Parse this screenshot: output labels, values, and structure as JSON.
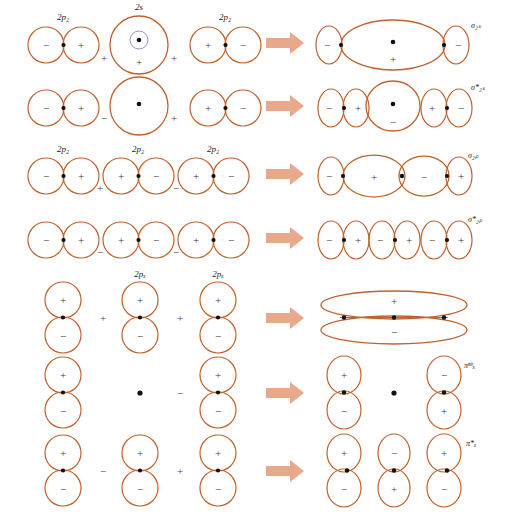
{
  "figure": {
    "colors": {
      "orbital_stroke": "#c0622d",
      "arrow_fill": "#e8a88a",
      "nucleus_dot": "#111111",
      "text": "#1a1a1a",
      "background": "#ffffff"
    }
  },
  "arrow": {
    "glyph": "right-arrow",
    "count": 7
  },
  "rows": [
    {
      "id": "row-sigma-2s",
      "left": {
        "orbitals": [
          {
            "label": "2p₂",
            "type": "p-horizontal",
            "lobes": [
              "−",
              "+"
            ]
          },
          {
            "label": "2s",
            "type": "s-with-node",
            "lobes": [
              "+"
            ]
          },
          {
            "label": "2p₂",
            "type": "p-horizontal",
            "lobes": [
              "+",
              "−"
            ]
          }
        ],
        "operators": [
          "+",
          "+"
        ]
      },
      "right": {
        "label": "σ₂ₛ",
        "label_plain": "sigma 2s",
        "description": "bonding sigma, small end lobes minus, large central lobe plus",
        "lobes": [
          "−",
          "+",
          "−"
        ]
      }
    },
    {
      "id": "row-sigma-2s-star",
      "left": {
        "orbitals": [
          {
            "label": "",
            "type": "p-horizontal",
            "lobes": [
              "−",
              "+"
            ]
          },
          {
            "label": "",
            "type": "s-plain",
            "lobes": [
              ""
            ]
          },
          {
            "label": "",
            "type": "p-horizontal",
            "lobes": [
              "+",
              "−"
            ]
          }
        ],
        "operators": [
          "−",
          "+"
        ]
      },
      "right": {
        "label": "σ*₂ₛ",
        "label_plain": "sigma star 2s",
        "description": "antibonding sigma, outer p pairs plus central s with minus",
        "lobes": [
          "−",
          "+",
          "−",
          "+",
          "−"
        ]
      }
    },
    {
      "id": "row-sigma-2p",
      "left": {
        "orbitals": [
          {
            "label": "2p₂",
            "type": "p-horizontal",
            "lobes": [
              "−",
              "+"
            ]
          },
          {
            "label": "2p₂",
            "type": "p-horizontal",
            "lobes": [
              "+",
              "−"
            ]
          },
          {
            "label": "2p₂",
            "type": "p-horizontal",
            "lobes": [
              "+",
              "−"
            ]
          }
        ],
        "operators": [
          "+",
          "−"
        ]
      },
      "right": {
        "label": "σ₂ₚ",
        "label_plain": "sigma 2p",
        "description": "bonding sigma 2p with two large central lobes",
        "lobes": [
          "−",
          "+",
          "−",
          "+"
        ]
      }
    },
    {
      "id": "row-sigma-2p-star",
      "left": {
        "orbitals": [
          {
            "label": "",
            "type": "p-horizontal",
            "lobes": [
              "−",
              "+"
            ]
          },
          {
            "label": "",
            "type": "p-horizontal",
            "lobes": [
              "+",
              "−"
            ]
          },
          {
            "label": "",
            "type": "p-horizontal",
            "lobes": [
              "+",
              "−"
            ]
          }
        ],
        "operators": [
          "−",
          "−"
        ]
      },
      "right": {
        "label": "σ*₂ₚ",
        "label_plain": "sigma star 2p",
        "description": "antibonding sigma 2p, three separated p pairs",
        "lobes": [
          "−",
          "+",
          "−",
          "+",
          "−",
          "+"
        ]
      }
    },
    {
      "id": "row-pi-x",
      "left": {
        "orbitals": [
          {
            "label": "",
            "type": "p-vertical",
            "lobes": [
              "+",
              "−"
            ]
          },
          {
            "label": "2pₓ",
            "type": "p-vertical",
            "lobes": [
              "+",
              "−"
            ]
          },
          {
            "label": "2pₓ",
            "type": "p-vertical",
            "lobes": [
              "+",
              "−"
            ]
          }
        ],
        "operators": [
          "+",
          "+"
        ]
      },
      "right": {
        "label": "",
        "label_plain": "pi x bonding",
        "description": "delocalized pi bonding, long upper lobe plus and lower lobe minus",
        "lobes": [
          "+",
          "−"
        ]
      }
    },
    {
      "id": "row-pi-x-nb",
      "left": {
        "orbitals": [
          {
            "label": "",
            "type": "p-vertical",
            "lobes": [
              "+",
              "−"
            ]
          },
          {
            "label": "",
            "type": "dot-only",
            "lobes": []
          },
          {
            "label": "",
            "type": "p-vertical",
            "lobes": [
              "+",
              "−"
            ]
          }
        ],
        "operators": [
          "",
          "−"
        ]
      },
      "right": {
        "label": "πⁿᵇₓ",
        "label_plain": "pi nb x",
        "description": "nonbonding pi, outer lobes opposite phase, node at center",
        "lobes": [
          "+",
          "−",
          "−",
          "+"
        ]
      }
    },
    {
      "id": "row-pi-x-star",
      "left": {
        "orbitals": [
          {
            "label": "",
            "type": "p-vertical",
            "lobes": [
              "+",
              "−"
            ]
          },
          {
            "label": "",
            "type": "p-vertical",
            "lobes": [
              "+",
              "−"
            ]
          },
          {
            "label": "",
            "type": "p-vertical",
            "lobes": [
              "+",
              "−"
            ]
          }
        ],
        "operators": [
          "−",
          "+"
        ]
      },
      "right": {
        "label": "π*ₓ",
        "label_plain": "pi star x",
        "description": "antibonding pi, alternating phases across three centers",
        "lobes": [
          "+",
          "−",
          "−",
          "+",
          "+",
          "−"
        ]
      }
    }
  ]
}
